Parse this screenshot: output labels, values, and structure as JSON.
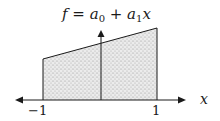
{
  "diagram": {
    "title": {
      "f": "f",
      "eq": " = ",
      "a0": "a",
      "a0_sub": "0",
      "plus": " + ",
      "a1": "a",
      "a1_sub": "1",
      "x": "x"
    },
    "x_axis_label": "x",
    "ticks": {
      "left": "−1",
      "right": "1"
    },
    "colors": {
      "line": "#1a1a1a",
      "fill": "#e6e6e6",
      "dots": "#8a8a8a"
    },
    "shape": "trapezoid under linear function f = a0 + a1 x over [-1, 1]"
  }
}
